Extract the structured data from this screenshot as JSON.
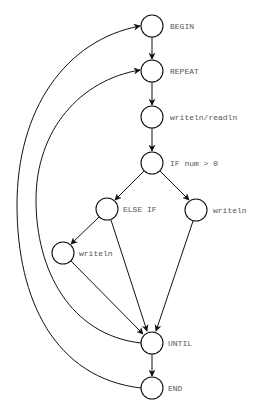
{
  "diagram": {
    "type": "control-flow-graph",
    "nodes": [
      {
        "id": "begin",
        "label": "BEGIN",
        "x": 152,
        "y": 26
      },
      {
        "id": "repeat",
        "label": "REPEAT",
        "x": 152,
        "y": 71
      },
      {
        "id": "io",
        "label": "writeln/readln",
        "x": 152,
        "y": 117
      },
      {
        "id": "if",
        "label": "IF num > 0",
        "x": 152,
        "y": 163
      },
      {
        "id": "elseif",
        "label": "ELSE IF",
        "x": 107,
        "y": 209
      },
      {
        "id": "writeln_right",
        "label": "writeln",
        "x": 196,
        "y": 210
      },
      {
        "id": "writeln_left",
        "label": "writeln",
        "x": 63,
        "y": 253
      },
      {
        "id": "until",
        "label": "UNTIL",
        "x": 152,
        "y": 343
      },
      {
        "id": "end",
        "label": "END",
        "x": 152,
        "y": 388
      }
    ],
    "edges": [
      {
        "from": "begin",
        "to": "repeat"
      },
      {
        "from": "repeat",
        "to": "io"
      },
      {
        "from": "io",
        "to": "if"
      },
      {
        "from": "if",
        "to": "elseif"
      },
      {
        "from": "if",
        "to": "writeln_right"
      },
      {
        "from": "elseif",
        "to": "writeln_left"
      },
      {
        "from": "elseif",
        "to": "until"
      },
      {
        "from": "writeln_left",
        "to": "until"
      },
      {
        "from": "writeln_right",
        "to": "until"
      },
      {
        "from": "until",
        "to": "repeat"
      },
      {
        "from": "until",
        "to": "end"
      },
      {
        "from": "end",
        "to": "begin"
      }
    ]
  },
  "labels": {
    "begin": "BEGIN",
    "repeat": "REPEAT",
    "io": "writeln/readln",
    "if": "IF num > 0",
    "elseif": "ELSE IF",
    "writeln_right": "writeln",
    "writeln_left": "writeln",
    "until": "UNTIL",
    "end": "END"
  }
}
